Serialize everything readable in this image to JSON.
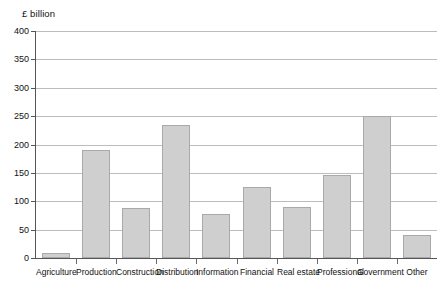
{
  "chart_data": {
    "type": "bar",
    "title": "",
    "subtitle": "",
    "unit_label": "£ billion",
    "xlabel": "",
    "ylabel": "£ billion",
    "ylim": [
      0,
      400
    ],
    "y_ticks": [
      0,
      50,
      100,
      150,
      200,
      250,
      300,
      350,
      400
    ],
    "y_tick_labels": [
      "0",
      "50",
      "100",
      "150",
      "200",
      "250",
      "300",
      "350",
      "400"
    ],
    "grid": true,
    "legend": "none",
    "categories": [
      "Agriculture",
      "Production",
      "Construction",
      "Distribution",
      "Information",
      "Financial",
      "Real estate",
      "Professional",
      "Government",
      "Other"
    ],
    "values": [
      8,
      190,
      88,
      235,
      77,
      125,
      90,
      147,
      251,
      40
    ],
    "series": [
      {
        "name": "£ billion",
        "values": [
          8,
          190,
          88,
          235,
          77,
          125,
          90,
          147,
          251,
          40
        ]
      }
    ],
    "colors": {
      "bar_fill": "#cfcfcf",
      "bar_border": "#a9a9a9",
      "gridline": "#bcbcbc",
      "axis": "#555555",
      "text": "#111111",
      "background": "#ffffff"
    }
  }
}
